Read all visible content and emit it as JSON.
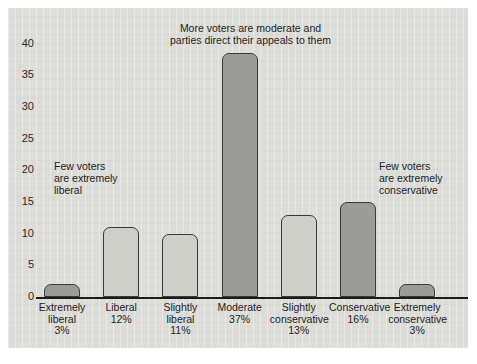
{
  "chart_data": {
    "type": "bar",
    "title": "",
    "xlabel": "",
    "ylabel": "",
    "ylim": [
      0,
      42
    ],
    "grid": false,
    "legend": "none",
    "yticks": [
      0,
      5,
      10,
      15,
      20,
      25,
      30,
      35,
      40
    ],
    "categories": [
      "Extremely liberal",
      "Liberal",
      "Slightly liberal",
      "Moderate",
      "Slightly conservative",
      "Conservative",
      "Extremely conservative"
    ],
    "values": [
      2,
      11,
      10,
      38.5,
      13,
      15,
      2
    ],
    "percent_labels": [
      "3%",
      "12%",
      "11%",
      "37%",
      "13%",
      "16%",
      "3%"
    ],
    "bars": [
      {
        "name": "Extremely liberal",
        "line1": "Extremely",
        "line2": "liberal",
        "percent": "3%",
        "value": 2,
        "shade": "dark"
      },
      {
        "name": "Liberal",
        "line1": "Liberal",
        "line2": "",
        "percent": "12%",
        "value": 11,
        "shade": "light"
      },
      {
        "name": "Slightly liberal",
        "line1": "Slightly",
        "line2": "liberal",
        "percent": "11%",
        "value": 10,
        "shade": "light"
      },
      {
        "name": "Moderate",
        "line1": "Moderate",
        "line2": "",
        "percent": "37%",
        "value": 38.5,
        "shade": "dark"
      },
      {
        "name": "Slightly conservative",
        "line1": "Slightly",
        "line2": "conservative",
        "percent": "13%",
        "value": 13,
        "shade": "light"
      },
      {
        "name": "Conservative",
        "line1": "Conservative",
        "line2": "",
        "percent": "16%",
        "value": 15,
        "shade": "dark"
      },
      {
        "name": "Extremely conservative",
        "line1": "Extremely",
        "line2": "conservative",
        "percent": "3%",
        "value": 2,
        "shade": "dark"
      }
    ],
    "annotations": [
      {
        "id": "left",
        "text": "Few voters are extremely liberal"
      },
      {
        "id": "top",
        "text": "More voters are moderate and parties direct their appeals to them"
      },
      {
        "id": "right",
        "text": "Few voters are extremely conservative"
      }
    ]
  },
  "annotations": {
    "left_line1": "Few voters",
    "left_line2": "are extremely",
    "left_line3": "liberal",
    "top_line1": "More voters are moderate and",
    "top_line2": "parties direct their appeals to them",
    "right_line1": "Few voters",
    "right_line2": "are extremely",
    "right_line3": "conservative"
  },
  "colors": {
    "panel_background": "#dcdcd8",
    "bar_light": "#cfcfca",
    "bar_dark": "#9b9b99",
    "bar_outline": "#3a3a3a",
    "axis": "#1a1a1a",
    "text": "#1e1e1e"
  }
}
